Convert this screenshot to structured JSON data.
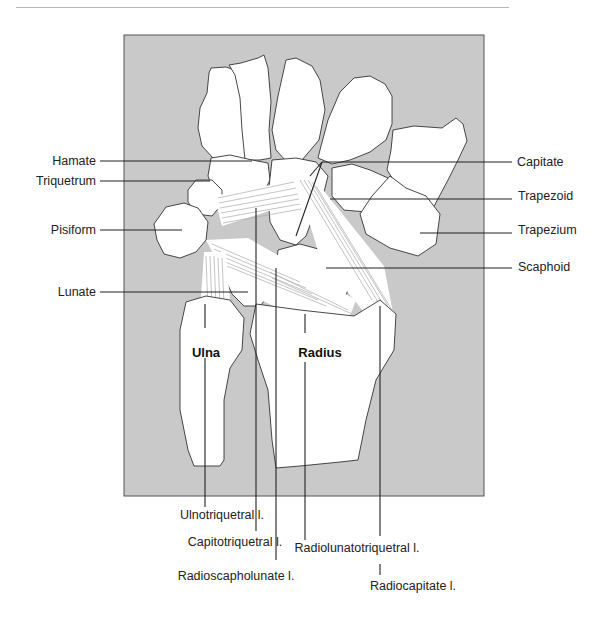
{
  "figure": {
    "panel_background": "#c9c9c9",
    "bone_fill": "#ffffff",
    "line_color": "#222222"
  },
  "labels_left": {
    "hamate": "Hamate",
    "triquetrum": "Triquetrum",
    "pisiform": "Pisiform",
    "lunate": "Lunate"
  },
  "labels_right": {
    "capitate": "Capitate",
    "trapezoid": "Trapezoid",
    "trapezium": "Trapezium",
    "scaphoid": "Scaphoid"
  },
  "labels_bones": {
    "ulna": "Ulna",
    "radius": "Radius"
  },
  "labels_bottom": {
    "ulnotriquetral": "Ulnotriquetral l.",
    "capitotriquetral": "Capitotriquetral l.",
    "radioscapholunate": "Radioscapholunate l.",
    "radiolunatotriquetral": "Radiolunatotriquetral l.",
    "radiocapitate": "Radiocapitate l."
  }
}
